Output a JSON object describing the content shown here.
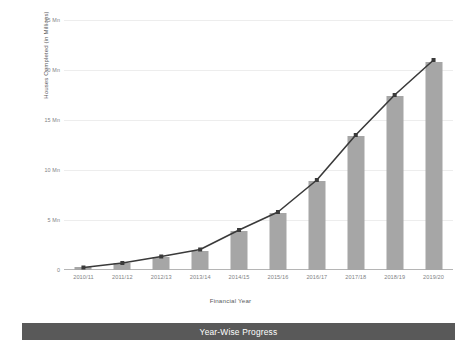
{
  "banner": {
    "label": "Year-Wise Progress",
    "background": "#595959",
    "text_color": "#ffffff"
  },
  "chart_data": {
    "type": "bar",
    "title": "",
    "subtitle": "",
    "xlabel": "Financial Year",
    "ylabel": "Houses Completed (in Millions)",
    "categories": [
      "2010/11",
      "2011/12",
      "2012/13",
      "2013/14",
      "2014/15",
      "2015/16",
      "2016/17",
      "2017/18",
      "2018/19",
      "2019/20"
    ],
    "values": [
      0.3,
      0.7,
      1.3,
      1.9,
      3.9,
      5.7,
      8.9,
      13.4,
      17.4,
      20.8
    ],
    "series": [
      {
        "name": "Houses Completed (bars)",
        "type": "bar",
        "values": [
          0.3,
          0.7,
          1.3,
          1.9,
          3.9,
          5.7,
          8.9,
          13.4,
          17.4,
          20.8
        ],
        "color": "#a6a6a6"
      },
      {
        "name": "Trend",
        "type": "line",
        "values": [
          0.25,
          0.7,
          1.35,
          2.05,
          4.0,
          5.8,
          9.0,
          13.5,
          17.5,
          21.0
        ],
        "color": "#3a3a3a",
        "marker": "square"
      }
    ],
    "ylim": [
      0,
      25
    ],
    "yticks": [
      0,
      5,
      10,
      15,
      20,
      25
    ],
    "ytick_labels": [
      "0",
      "5 Mn",
      "10 Mn",
      "15 Mn",
      "20 Mn",
      "25 Mn"
    ],
    "grid": true,
    "grid_color": "#ededed",
    "legend": false,
    "legend_position": "none",
    "background": "#ffffff",
    "axis_label_color": "#808285"
  }
}
